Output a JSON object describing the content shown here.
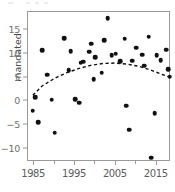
{
  "chart_data": {
    "type": "scatter",
    "title": "",
    "xlabel": "",
    "ylabel": "mandated",
    "xlim": [
      1983.5,
      2018.5
    ],
    "ylim": [
      -12.8,
      18.8
    ],
    "grid": false,
    "legend": "none",
    "x_ticks": [
      1985,
      1990,
      1995,
      2000,
      2005,
      2010,
      2015
    ],
    "x_tick_labels": [
      "1985",
      "",
      "1995",
      "",
      "2005",
      "",
      "2015"
    ],
    "y_ticks": [
      -10,
      -5,
      0,
      5,
      10,
      15
    ],
    "y_tick_labels": [
      "−10",
      "−5",
      "0",
      "5",
      "10",
      "15"
    ],
    "point_color": "#111111",
    "trend_color": "#111111",
    "trend_style": "dashed",
    "series": [
      {
        "name": "observations",
        "x": [
          1984.7,
          1985.2,
          1986.0,
          1987.0,
          1988.2,
          1989.3,
          1990.0,
          1992.3,
          1993.5,
          1994.0,
          1995.0,
          1996.0,
          1996.4,
          1997.0,
          1998.5,
          1999.0,
          1999.6,
          2000.0,
          2001.5,
          2002.2,
          2003.0,
          2004.0,
          2005.0,
          2006.0,
          2007.2,
          2007.6,
          2008.3,
          2009.0,
          2010.0,
          2011.5,
          2012.0,
          2013.0,
          2013.6,
          2014.5,
          2015.0,
          2016.0,
          2017.3,
          2017.8,
          2018.2
        ],
        "y": [
          -2.0,
          0.8,
          -4.4,
          10.7,
          5.6,
          0.3,
          -6.6,
          13.3,
          6.6,
          10.6,
          0.4,
          -0.3,
          8.1,
          8.3,
          10.4,
          12.1,
          4.7,
          9.3,
          6.0,
          12.9,
          17.5,
          9.7,
          10.0,
          8.4,
          13.2,
          -0.9,
          -6.0,
          8.5,
          11.3,
          9.8,
          7.5,
          13.6,
          -11.9,
          -2.5,
          9.7,
          8.6,
          10.9,
          6.8,
          5.2
        ]
      }
    ],
    "trend_curve": {
      "name": "fitted quadratic trend",
      "x": [
        1984.7,
        1987.0,
        1990.0,
        1993.0,
        1996.0,
        1999.0,
        2002.0,
        2005.0,
        2008.0,
        2011.0,
        2014.0,
        2017.0,
        2018.3
      ],
      "y": [
        1.0,
        3.0,
        4.6,
        5.8,
        6.7,
        7.4,
        7.8,
        7.9,
        7.7,
        7.2,
        6.4,
        5.4,
        5.0
      ]
    }
  },
  "axes": {
    "y_title": "mandated"
  }
}
